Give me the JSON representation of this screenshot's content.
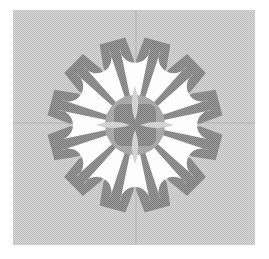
{
  "canvas": {
    "width": 269,
    "height": 259,
    "background_color": "#ffffff",
    "title": "Twelve-petal rosette ornament"
  },
  "panel": {
    "name": "dithered-gray-square-panel",
    "x": 13,
    "y": 10,
    "width": 242,
    "height": 235,
    "fill_color": "#c9c9c9",
    "dither": "halftone-25-percent"
  },
  "guides": {
    "vertical": {
      "x": 136,
      "color": "#b3b3b3",
      "width": 1
    },
    "horizontal": {
      "y": 123,
      "color": "#b3b3b3",
      "width": 1
    }
  },
  "rosette": {
    "center_x": 135,
    "center_y": 125,
    "petal_count": 12,
    "wedge_count": 12,
    "angle_step_degrees": 30,
    "wedge_offset_degrees": 15,
    "wedge": {
      "name": "dark-gray-wedge",
      "fill_color": "#8a8a8a",
      "inner_radius": 24,
      "outer_radius": 88,
      "half_angle_degrees": 14
    },
    "petal": {
      "name": "white-teardrop-petal",
      "fill_color": "#fdfdfd",
      "inner_radius": 24,
      "outer_radius": 92,
      "bulb_radius": 15,
      "neck_half_width": 4
    },
    "core": {
      "name": "center-disc",
      "radius": 30,
      "fill_color": "#a8a8a8",
      "inner_square": {
        "name": "center-rounded-square",
        "half_size": 21,
        "corner_radius": 8,
        "fill_color": "#8a8a8a"
      },
      "lens_count": 4,
      "lens": {
        "name": "center-lens",
        "fill_color": "#d2d2d2",
        "length": 34,
        "width": 13,
        "offset": 22
      }
    }
  },
  "palette": {
    "paper": "#ffffff",
    "panel_gray": "#c9c9c9",
    "wedge_gray": "#8a8a8a",
    "petal_white": "#fdfdfd",
    "core_gray": "#a8a8a8",
    "lens_gray": "#d2d2d2",
    "guide_gray": "#b3b3b3"
  }
}
